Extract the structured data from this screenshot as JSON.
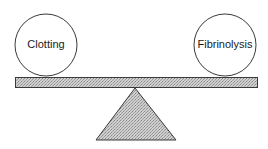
{
  "diagram": {
    "title": "",
    "left_weight": {
      "label": "Clotting"
    },
    "right_weight": {
      "label": "Fibrinolysis"
    },
    "beam": {
      "pattern": "stippled-gray"
    },
    "fulcrum": {
      "shape": "triangle",
      "pattern": "stippled-gray"
    },
    "colors": {
      "stroke": "#3a3a3a",
      "fill": "#bdbdbd",
      "background": "#ffffff"
    }
  }
}
